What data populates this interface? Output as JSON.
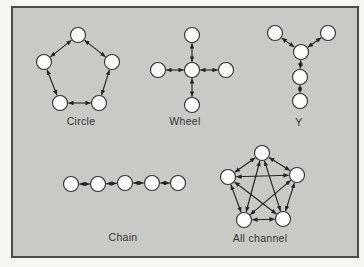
{
  "figure": {
    "background_color": "#f6f6f3",
    "panel": {
      "fill": "#c9c9c6",
      "border_color": "#4a4a47",
      "x": 12,
      "y": 7,
      "width": 346,
      "height": 250
    },
    "node_style": {
      "fill": "#fcfcfa",
      "stroke": "#2e2e2c",
      "radius": 7.5
    },
    "arrow_color": "#242421",
    "label_color": "#34342f"
  },
  "networks": [
    {
      "name": "circle",
      "label": "Circle",
      "label_pos": [
        81,
        116
      ],
      "nodes": [
        [
          78,
          35
        ],
        [
          44,
          62
        ],
        [
          112,
          62
        ],
        [
          60,
          103
        ],
        [
          99,
          103
        ]
      ],
      "edges": [
        [
          0,
          1
        ],
        [
          0,
          2
        ],
        [
          1,
          3
        ],
        [
          2,
          4
        ],
        [
          3,
          4
        ]
      ]
    },
    {
      "name": "wheel",
      "label": "Wheel",
      "label_pos": [
        185,
        116
      ],
      "nodes": [
        [
          192,
          70
        ],
        [
          192,
          35
        ],
        [
          226,
          70
        ],
        [
          192,
          105
        ],
        [
          158,
          70
        ]
      ],
      "edges": [
        [
          0,
          1
        ],
        [
          0,
          2
        ],
        [
          0,
          3
        ],
        [
          0,
          4
        ]
      ]
    },
    {
      "name": "y",
      "label": "Y",
      "label_pos": [
        299,
        117
      ],
      "nodes": [
        [
          275,
          33
        ],
        [
          328,
          33
        ],
        [
          301,
          52
        ],
        [
          300,
          77
        ],
        [
          300,
          101
        ]
      ],
      "edges": [
        [
          0,
          2
        ],
        [
          1,
          2
        ],
        [
          2,
          3
        ],
        [
          3,
          4
        ]
      ]
    },
    {
      "name": "chain",
      "label": "Chain",
      "label_pos": [
        123,
        232
      ],
      "nodes": [
        [
          71,
          184
        ],
        [
          98,
          184
        ],
        [
          125,
          183
        ],
        [
          152,
          183
        ],
        [
          178,
          183
        ]
      ],
      "edges": [
        [
          0,
          1
        ],
        [
          1,
          2
        ],
        [
          2,
          3
        ],
        [
          3,
          4
        ]
      ]
    },
    {
      "name": "all-channel",
      "label": "All channel",
      "label_pos": [
        260,
        233
      ],
      "nodes": [
        [
          262,
          153
        ],
        [
          228,
          177
        ],
        [
          297,
          175
        ],
        [
          244,
          220
        ],
        [
          283,
          219
        ]
      ],
      "edges": [
        [
          0,
          1
        ],
        [
          0,
          2
        ],
        [
          0,
          3
        ],
        [
          0,
          4
        ],
        [
          1,
          2
        ],
        [
          1,
          3
        ],
        [
          1,
          4
        ],
        [
          2,
          3
        ],
        [
          2,
          4
        ],
        [
          3,
          4
        ]
      ]
    }
  ]
}
